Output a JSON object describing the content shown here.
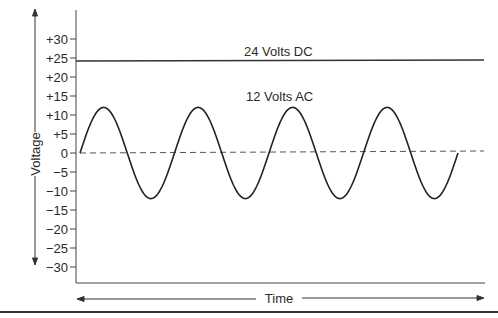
{
  "chart_data": {
    "type": "line",
    "title": "",
    "xlabel": "Time",
    "ylabel": "Voltage",
    "ylim": [
      -35,
      35
    ],
    "yticks": [
      "+30",
      "+25",
      "+20",
      "+15",
      "+10",
      "+5",
      "0",
      "−5",
      "−10",
      "−15",
      "−20",
      "−25",
      "−30"
    ],
    "ytick_values": [
      30,
      25,
      20,
      15,
      10,
      5,
      0,
      -5,
      -10,
      -15,
      -20,
      -25,
      -30
    ],
    "grid": false,
    "legend": "none",
    "annotations": [
      {
        "text": "24 Volts DC",
        "attached_to": "dc"
      },
      {
        "text": "12 Volts AC",
        "attached_to": "ac"
      }
    ],
    "series": [
      {
        "name": "24 Volts DC",
        "kind": "constant",
        "value": 24,
        "style": "solid"
      },
      {
        "name": "12 Volts AC",
        "kind": "sine",
        "amplitude": 12,
        "offset": 0,
        "cycles": 4,
        "style": "solid"
      },
      {
        "name": "Zero reference",
        "kind": "constant",
        "value": 0,
        "style": "dashed"
      }
    ]
  },
  "labels": {
    "dc": "24 Volts DC",
    "ac": "12 Volts AC",
    "x_axis": "Time",
    "y_axis": "Voltage"
  }
}
